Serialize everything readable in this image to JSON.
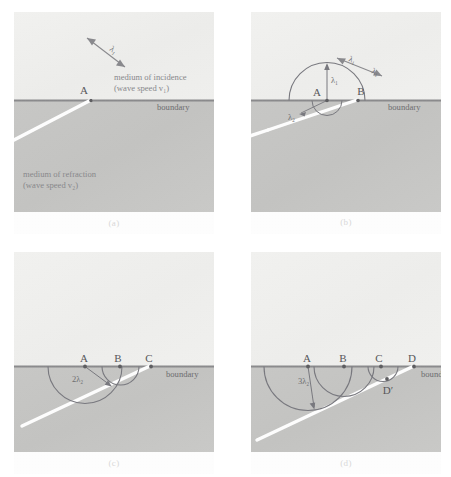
{
  "figure": {
    "panels": [
      {
        "id": "a",
        "caption": "(a)",
        "boundary_label": "boundary",
        "medium_upper_line1": "medium of incidence",
        "medium_upper_line2": "(wave speed v₁)",
        "medium_lower_line1": "medium of refraction",
        "medium_lower_line2": "(wave speed v₂)",
        "wavelength_label": "λ₁",
        "points": [
          {
            "label": "A"
          }
        ]
      },
      {
        "id": "b",
        "caption": "(b)",
        "boundary_label": "boundary",
        "wavelength_label_incident": "λ₁",
        "wavelength_label_incident2": "λ₁",
        "wavelet_radius_label": "λ₁",
        "wavelength_label_refracted": "λ₂",
        "points": [
          {
            "label": "A"
          },
          {
            "label": "B"
          }
        ]
      },
      {
        "id": "c",
        "caption": "(c)",
        "boundary_label": "boundary",
        "wavelet_radius_label": "2λ₂",
        "points": [
          {
            "label": "A"
          },
          {
            "label": "B"
          },
          {
            "label": "C"
          }
        ]
      },
      {
        "id": "d",
        "caption": "(d)",
        "boundary_label": "boundary",
        "wavelet_radius_label": "3λ₂",
        "refracted_point_label": "D′",
        "points": [
          {
            "label": "A"
          },
          {
            "label": "B"
          },
          {
            "label": "C"
          },
          {
            "label": "D"
          }
        ]
      }
    ]
  },
  "colors": {
    "page_background": "#ffffff",
    "medium_upper": "#f0f0ee",
    "medium_lower": "#c7c7c5",
    "boundary_line": "#8c8c8e",
    "wavefront": "#ffffff",
    "arc": "#7a7a80",
    "text": "#6f6f72",
    "caption": "#d8d8d8"
  }
}
